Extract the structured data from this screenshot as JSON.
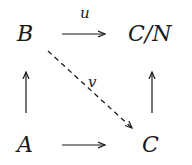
{
  "diagram": {
    "type": "commutative-square",
    "nodes": {
      "top_left": "B",
      "top_right": "C/N",
      "bottom_left": "A",
      "bottom_right": "C"
    },
    "edges": [
      {
        "from": "B",
        "to": "C/N",
        "label": "u",
        "style": "solid"
      },
      {
        "from": "A",
        "to": "C",
        "label": "",
        "style": "solid"
      },
      {
        "from": "A",
        "to": "B",
        "label": "",
        "style": "solid"
      },
      {
        "from": "C",
        "to": "C/N",
        "label": "",
        "style": "solid"
      },
      {
        "from": "B",
        "to": "C",
        "label": "v",
        "style": "dashed"
      }
    ],
    "labels": {
      "u": "u",
      "v": "v"
    }
  }
}
